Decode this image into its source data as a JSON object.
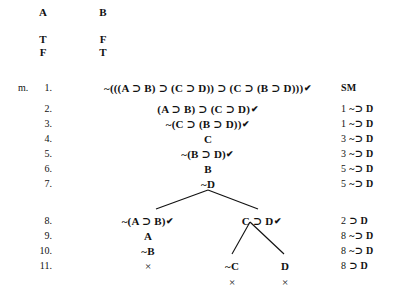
{
  "table_header": {
    "columns": [
      {
        "label": "A",
        "x": 43
      },
      {
        "label": "B",
        "x": 103
      }
    ],
    "rows": [
      {
        "values": [
          "T",
          "F"
        ]
      },
      {
        "values": [
          "F",
          "T"
        ]
      }
    ]
  },
  "marker": "m.",
  "check_glyph": "✔",
  "close_glyph": "×",
  "horseshoe": "⊃",
  "negation": "~",
  "lines": [
    {
      "number": "1.",
      "formula": "~(((A ⊃ B) ⊃ (C ⊃ D)) ⊃ (C ⊃ (B ⊃ D)))",
      "checked": true,
      "justification_ref": "",
      "justification_rule": "SM",
      "x": 208,
      "y": 82
    },
    {
      "number": "2.",
      "formula": "(A ⊃ B) ⊃ (C ⊃ D)",
      "checked": true,
      "justification_ref": "1",
      "justification_rule": "~⊃ D",
      "x": 208,
      "y": 103
    },
    {
      "number": "3.",
      "formula": "~(C ⊃ (B ⊃ D))",
      "checked": true,
      "justification_ref": "1",
      "justification_rule": "~⊃ D",
      "x": 208,
      "y": 118
    },
    {
      "number": "4.",
      "formula": "C",
      "checked": false,
      "justification_ref": "3",
      "justification_rule": "~⊃ D",
      "x": 208,
      "y": 133
    },
    {
      "number": "5.",
      "formula": "~(B ⊃ D)",
      "checked": true,
      "justification_ref": "3",
      "justification_rule": "~⊃ D",
      "x": 208,
      "y": 148
    },
    {
      "number": "6.",
      "formula": "B",
      "checked": false,
      "justification_ref": "5",
      "justification_rule": "~⊃ D",
      "x": 208,
      "y": 163
    },
    {
      "number": "7.",
      "formula": "~D",
      "checked": false,
      "justification_ref": "5",
      "justification_rule": "~⊃ D",
      "x": 208,
      "y": 178
    },
    {
      "number": "8.",
      "formula": "",
      "checked": false,
      "justification_ref": "2",
      "justification_rule": "⊃ D",
      "x": 208,
      "y": 215
    },
    {
      "number": "9.",
      "formula": "",
      "checked": false,
      "justification_ref": "8",
      "justification_rule": "~⊃ D",
      "x": 208,
      "y": 230
    },
    {
      "number": "10.",
      "formula": "",
      "checked": false,
      "justification_ref": "8",
      "justification_rule": "~⊃ D",
      "x": 208,
      "y": 245
    },
    {
      "number": "11.",
      "formula": "",
      "checked": false,
      "justification_ref": "8",
      "justification_rule": "⊃ D",
      "x": 208,
      "y": 260
    }
  ],
  "branch_nodes": [
    {
      "id": "n8-left",
      "text": "~(A ⊃ B)",
      "checked": true,
      "x": 148,
      "y": 215
    },
    {
      "id": "n8-right",
      "text": "C ⊃ D",
      "checked": true,
      "x": 262,
      "y": 215
    },
    {
      "id": "n9-left",
      "text": "A",
      "checked": false,
      "x": 148,
      "y": 230
    },
    {
      "id": "n10-left",
      "text": "~B",
      "checked": false,
      "x": 148,
      "y": 245
    },
    {
      "id": "n11-c",
      "text": "~C",
      "checked": false,
      "x": 232,
      "y": 260
    },
    {
      "id": "n11-d",
      "text": "D",
      "checked": false,
      "x": 285,
      "y": 260
    }
  ],
  "close_marks": [
    {
      "id": "close-left",
      "x": 148,
      "y": 260
    },
    {
      "id": "close-notc",
      "x": 232,
      "y": 276
    },
    {
      "id": "close-d",
      "x": 285,
      "y": 276
    }
  ],
  "branch_lines": [
    {
      "id": "branch-7-to-8-left",
      "x1": 208,
      "y1": 190,
      "x2": 156,
      "y2": 209
    },
    {
      "id": "branch-7-to-8-right",
      "x1": 208,
      "y1": 190,
      "x2": 258,
      "y2": 209
    },
    {
      "id": "branch-8-to-11-left",
      "x1": 250,
      "y1": 222,
      "x2": 232,
      "y2": 254
    },
    {
      "id": "branch-8-to-11-right",
      "x1": 250,
      "y1": 222,
      "x2": 284,
      "y2": 254
    }
  ],
  "columns": {
    "marker_x": 18,
    "linenum_right_x": 52,
    "justification_x": 341
  }
}
